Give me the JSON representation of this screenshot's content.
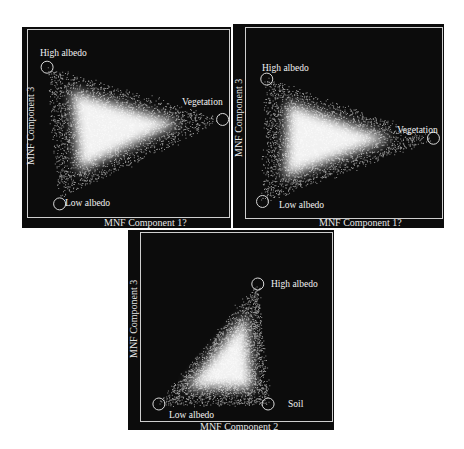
{
  "chart_data": [
    {
      "type": "scatter",
      "title": "",
      "xlabel": "MNF Component 1",
      "ylabel": "MNF Component 3",
      "grid": false,
      "legend": null,
      "annotations": [
        {
          "label": "High albedo",
          "cx": 0.12,
          "cy": 0.2
        },
        {
          "label": "Vegetation",
          "cx": 0.96,
          "cy": 0.46
        },
        {
          "label": "Low albedo",
          "cx": 0.18,
          "cy": 0.88
        }
      ],
      "shape": "triangle / density cloud",
      "vertices": [
        [
          0.12,
          0.2
        ],
        [
          0.96,
          0.46
        ],
        [
          0.18,
          0.85
        ]
      ]
    },
    {
      "type": "scatter",
      "title": "",
      "xlabel": "MNF Component 1",
      "ylabel": "MNF Component 3",
      "grid": false,
      "legend": null,
      "annotations": [
        {
          "label": "High albedo",
          "cx": 0.16,
          "cy": 0.27
        },
        {
          "label": "Vegetation",
          "cx": 0.95,
          "cy": 0.56
        },
        {
          "label": "Low albedo",
          "cx": 0.14,
          "cy": 0.87
        }
      ],
      "shape": "curved triangle / density cloud",
      "vertices": [
        [
          0.16,
          0.27
        ],
        [
          0.95,
          0.56
        ],
        [
          0.14,
          0.87
        ]
      ]
    },
    {
      "type": "scatter",
      "title": "",
      "xlabel": "MNF Component 2",
      "ylabel": "MNF Component 3",
      "grid": false,
      "legend": null,
      "annotations": [
        {
          "label": "High albedo",
          "cx": 0.63,
          "cy": 0.27
        },
        {
          "label": "Low albedo",
          "cx": 0.15,
          "cy": 0.87
        },
        {
          "label": "Soil",
          "cx": 0.68,
          "cy": 0.87
        }
      ],
      "shape": "triangle / density cloud",
      "vertices": [
        [
          0.63,
          0.27
        ],
        [
          0.15,
          0.87
        ],
        [
          0.68,
          0.87
        ]
      ]
    }
  ],
  "plots": [
    {
      "x": 22,
      "y": 27,
      "w": 209,
      "h": 201,
      "xlabel": "MNF Component 1?",
      "ylabel": "MNF Component 3",
      "labels": {
        "high": "High albedo",
        "veg": "Vegetation",
        "low": "Low albedo"
      }
    },
    {
      "x": 233,
      "y": 24,
      "w": 211,
      "h": 204,
      "xlabel": "MNF Component 1?",
      "ylabel": "MNF Component 3",
      "labels": {
        "high": "High albedo",
        "veg": "Vegetation",
        "low": "Low albedo"
      }
    },
    {
      "x": 128,
      "y": 230,
      "w": 206,
      "h": 200,
      "xlabel": "MNF Component 2",
      "ylabel": "MNF Component 3",
      "labels": {
        "high": "High albedo",
        "low": "Low albedo",
        "soil": "Soil"
      }
    }
  ],
  "colors": {
    "background": "#0c0c0c",
    "points": "#ffffff",
    "circle": "#d8d8d8",
    "frame": "#cfcfcf"
  }
}
